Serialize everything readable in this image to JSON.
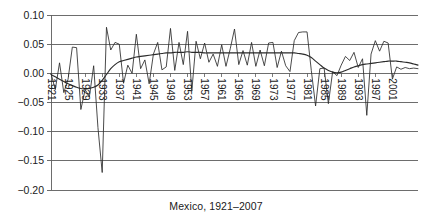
{
  "chart_data": {
    "type": "line",
    "title": "Mexico, 1921–2007",
    "xlabel": "",
    "ylabel": "",
    "xlim": [
      1921,
      2007
    ],
    "ylim": [
      -0.2,
      0.1
    ],
    "grid": true,
    "legend": "none",
    "y_ticks": [
      0.1,
      0.05,
      0.0,
      -0.05,
      -0.1,
      -0.15,
      -0.2
    ],
    "y_tick_labels": [
      "0.10",
      "0.05",
      "0.00",
      "-0.05",
      "-0.10",
      "-0.15",
      "-0.20"
    ],
    "x_ticks": [
      1921,
      1925,
      1929,
      1933,
      1937,
      1941,
      1945,
      1949,
      1953,
      1957,
      1961,
      1965,
      1969,
      1973,
      1977,
      1981,
      1985,
      1989,
      1993,
      1997,
      2001
    ],
    "x_tick_labels": [
      "1921",
      "1925",
      "1929",
      "1933",
      "1937",
      "1941",
      "1945",
      "1949",
      "1953",
      "1957",
      "1961",
      "1965",
      "1969",
      "1973",
      "1977",
      "1981",
      "1985",
      "1989",
      "1993",
      "1997",
      "2001"
    ],
    "x_tick_rotation": 90,
    "x": [
      1921,
      1922,
      1923,
      1924,
      1925,
      1926,
      1927,
      1928,
      1929,
      1930,
      1931,
      1932,
      1933,
      1934,
      1935,
      1936,
      1937,
      1938,
      1939,
      1940,
      1941,
      1942,
      1943,
      1944,
      1945,
      1946,
      1947,
      1948,
      1949,
      1950,
      1951,
      1952,
      1953,
      1954,
      1955,
      1956,
      1957,
      1958,
      1959,
      1960,
      1961,
      1962,
      1963,
      1964,
      1965,
      1966,
      1967,
      1968,
      1969,
      1970,
      1971,
      1972,
      1973,
      1974,
      1975,
      1976,
      1977,
      1978,
      1979,
      1980,
      1981,
      1982,
      1983,
      1984,
      1985,
      1986,
      1987,
      1988,
      1989,
      1990,
      1991,
      1992,
      1993,
      1994,
      1995,
      1996,
      1997,
      1998,
      1999,
      2000,
      2001,
      2002,
      2003,
      2004,
      2005,
      2006,
      2007
    ],
    "series": [
      {
        "name": "annual-rate",
        "style": "thin-volatile",
        "color": "#2b2b2b",
        "values": [
          0.0,
          -0.028,
          0.018,
          -0.033,
          -0.01,
          0.045,
          0.044,
          -0.062,
          -0.028,
          -0.04,
          0.013,
          -0.093,
          -0.17,
          0.079,
          0.04,
          0.053,
          0.05,
          -0.017,
          0.014,
          0.0,
          0.067,
          0.008,
          0.023,
          -0.018,
          0.033,
          0.053,
          0.006,
          0.011,
          0.077,
          0.005,
          0.053,
          0.015,
          0.072,
          -0.03,
          0.055,
          0.025,
          0.052,
          0.019,
          0.033,
          0.012,
          0.049,
          0.012,
          0.042,
          0.076,
          0.015,
          0.039,
          0.014,
          0.053,
          0.012,
          0.04,
          0.013,
          0.052,
          0.053,
          0.01,
          0.038,
          0.013,
          0.003,
          0.056,
          0.07,
          0.071,
          0.071,
          0.005,
          -0.056,
          0.008,
          0.009,
          -0.052,
          0.003,
          -0.004,
          0.014,
          0.029,
          0.022,
          0.036,
          0.01,
          0.025,
          -0.072,
          0.033,
          0.056,
          0.038,
          0.055,
          0.052,
          -0.01,
          0.011,
          0.007,
          0.01,
          0.008,
          0.009,
          0.008
        ]
      },
      {
        "name": "smoothed-trend",
        "style": "smooth",
        "color": "#2b2b2b",
        "values": [
          -0.002,
          -0.006,
          -0.01,
          -0.014,
          -0.018,
          -0.021,
          -0.024,
          -0.026,
          -0.027,
          -0.026,
          -0.024,
          -0.02,
          -0.012,
          -0.002,
          0.008,
          0.015,
          0.02,
          0.022,
          0.024,
          0.026,
          0.028,
          0.029,
          0.03,
          0.031,
          0.032,
          0.033,
          0.034,
          0.035,
          0.035,
          0.036,
          0.036,
          0.036,
          0.037,
          0.036,
          0.036,
          0.036,
          0.035,
          0.035,
          0.035,
          0.035,
          0.035,
          0.035,
          0.035,
          0.035,
          0.035,
          0.035,
          0.035,
          0.035,
          0.035,
          0.035,
          0.035,
          0.035,
          0.035,
          0.035,
          0.035,
          0.035,
          0.035,
          0.035,
          0.034,
          0.033,
          0.031,
          0.027,
          0.021,
          0.015,
          0.009,
          0.005,
          0.002,
          0.001,
          0.002,
          0.005,
          0.008,
          0.011,
          0.013,
          0.015,
          0.016,
          0.017,
          0.018,
          0.019,
          0.02,
          0.021,
          0.021,
          0.021,
          0.02,
          0.019,
          0.018,
          0.016,
          0.014
        ]
      }
    ]
  }
}
